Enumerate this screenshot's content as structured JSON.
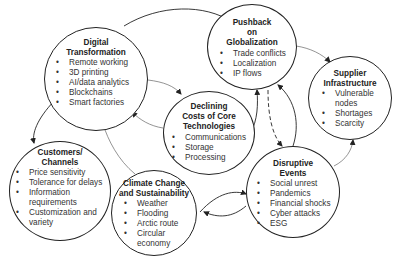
{
  "diagram": {
    "nodes": [
      {
        "id": "digital",
        "title_lines": [
          "Digital",
          "Transformation"
        ],
        "items": [
          "Remote working",
          "3D printing",
          "AI/data analytics",
          "Blockchains",
          "Smart factories"
        ]
      },
      {
        "id": "pushback",
        "title_lines": [
          "Pushback",
          "on",
          "Globalization"
        ],
        "items": [
          "Trade conflicts",
          "Localization",
          "IP flows"
        ]
      },
      {
        "id": "supplier",
        "title_lines": [
          "Supplier",
          "Infrastructure"
        ],
        "items": [
          "Vulnerable",
          "nodes",
          "Shortages",
          "Scarcity"
        ]
      },
      {
        "id": "declining",
        "title_lines": [
          "Declining",
          "Costs of Core",
          "Technologies"
        ],
        "items": [
          "Communications",
          "Storage",
          "Processing"
        ]
      },
      {
        "id": "customers",
        "title_lines": [
          "Customers/",
          "Channels"
        ],
        "items": [
          "Price sensitivity",
          "Tolerance for delays",
          "Information",
          "requirements",
          "Customization and",
          "variety"
        ]
      },
      {
        "id": "climate",
        "title_lines": [
          "Climate Change",
          "and Sustainability"
        ],
        "items": [
          "Weather",
          "Flooding",
          "Arctic route",
          "Circular",
          "economy"
        ]
      },
      {
        "id": "disruptive",
        "title_lines": [
          "Disruptive",
          "Events"
        ],
        "items": [
          "Social unrest",
          "Pandemics",
          "Financial shocks",
          "Cyber attacks",
          "ESG"
        ]
      }
    ],
    "edges": [
      {
        "from": "digital",
        "to": "pushback",
        "style": "solid"
      },
      {
        "from": "digital",
        "to": "declining",
        "style": "solid"
      },
      {
        "from": "declining",
        "to": "digital",
        "style": "solid"
      },
      {
        "from": "digital",
        "to": "customers",
        "style": "solid"
      },
      {
        "from": "climate",
        "to": "digital",
        "style": "solid"
      },
      {
        "from": "pushback",
        "to": "supplier",
        "style": "solid"
      },
      {
        "from": "declining",
        "to": "pushback",
        "style": "solid"
      },
      {
        "from": "pushback",
        "to": "disruptive",
        "style": "dashed"
      },
      {
        "from": "disruptive",
        "to": "pushback",
        "style": "solid"
      },
      {
        "from": "disruptive",
        "to": "supplier",
        "style": "solid"
      },
      {
        "from": "climate",
        "to": "disruptive",
        "style": "solid"
      },
      {
        "from": "disruptive",
        "to": "climate",
        "style": "solid"
      }
    ]
  }
}
